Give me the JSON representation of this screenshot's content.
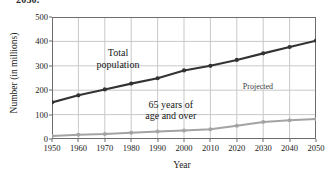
{
  "figure": {
    "clipped_heading": "2050.",
    "xlabel": "Year",
    "ylabel": "Number (in millions)",
    "annotations": {
      "total_line1": "Total",
      "total_line2": "population",
      "elderly_line1": "65 years of",
      "elderly_line2": "age and over",
      "projected": "Projected"
    },
    "colors": {
      "total_series": "#333333",
      "elderly_series": "#a3a3a3",
      "grid": "#c9c9c9",
      "axis": "#6d6d6d",
      "background": "#ffffff"
    }
  },
  "chart_data": {
    "type": "line",
    "title": "",
    "xlabel": "Year",
    "ylabel": "Number (in millions)",
    "x": [
      1950,
      1960,
      1970,
      1980,
      1990,
      2000,
      2010,
      2020,
      2030,
      2040,
      2050
    ],
    "xtick_labels": [
      "1950",
      "1960",
      "1970",
      "1980",
      "1990",
      "2000",
      "2010",
      "2020",
      "2030",
      "2040",
      "2050"
    ],
    "ytick_labels": [
      "0",
      "100",
      "200",
      "300",
      "400",
      "500"
    ],
    "yticks": [
      0,
      100,
      200,
      300,
      400,
      500
    ],
    "xlim": [
      1950,
      2050
    ],
    "ylim": [
      0,
      500
    ],
    "grid": true,
    "legend": "none",
    "series": [
      {
        "name": "Total population",
        "color": "#333333",
        "marker": "circle",
        "values": [
          150,
          179,
          203,
          227,
          249,
          281,
          300,
          324,
          351,
          377,
          403
        ]
      },
      {
        "name": "65 years of age and over",
        "color": "#a3a3a3",
        "marker": "circle",
        "values": [
          12,
          17,
          20,
          26,
          31,
          35,
          40,
          54,
          70,
          77,
          82
        ]
      }
    ],
    "annotations": [
      {
        "text": "Total population",
        "x": 1975,
        "y": 330
      },
      {
        "text": "65 years of age and over",
        "x": 1995,
        "y": 120
      },
      {
        "text": "Projected",
        "x": 2028,
        "y": 215
      }
    ]
  }
}
